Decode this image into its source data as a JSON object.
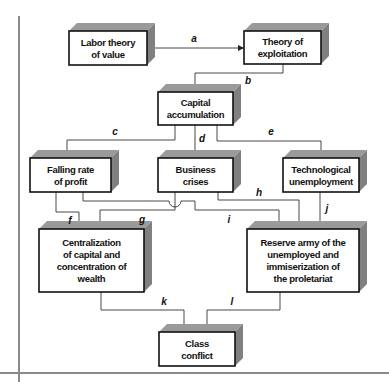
{
  "diagram": {
    "colors": {
      "face": "#ffffff",
      "border": "#111111",
      "shadow": "#9a9a9a",
      "rule": "#8a8a8a",
      "line": "#333333"
    },
    "nodes": [
      {
        "id": "labor_theory",
        "lines": [
          "Labor theory",
          "of value"
        ]
      },
      {
        "id": "exploitation",
        "lines": [
          "Theory of",
          "exploitation"
        ]
      },
      {
        "id": "capital_accumulation",
        "lines": [
          "Capital",
          "accumulation"
        ]
      },
      {
        "id": "falling_rate",
        "lines": [
          "Falling rate",
          "of profit"
        ]
      },
      {
        "id": "business_crises",
        "lines": [
          "Business",
          "crises"
        ]
      },
      {
        "id": "tech_unemployment",
        "lines": [
          "Technological",
          "unemployment"
        ]
      },
      {
        "id": "centralization",
        "lines": [
          "Centralization",
          "of capital and",
          "concentration of",
          "wealth"
        ]
      },
      {
        "id": "reserve_army",
        "lines": [
          "Reserve army of the",
          "unemployed and",
          "immiserization of",
          "the proletariat"
        ]
      },
      {
        "id": "class_conflict",
        "lines": [
          "Class",
          "conflict"
        ]
      }
    ],
    "edges": [
      {
        "label": "a",
        "from": "labor_theory",
        "to": "exploitation"
      },
      {
        "label": "b",
        "from": "exploitation",
        "to": "capital_accumulation"
      },
      {
        "label": "c",
        "from": "capital_accumulation",
        "to": "falling_rate"
      },
      {
        "label": "d",
        "from": "capital_accumulation",
        "to": "business_crises"
      },
      {
        "label": "e",
        "from": "capital_accumulation",
        "to": "tech_unemployment"
      },
      {
        "label": "f",
        "from": "falling_rate",
        "to": "centralization"
      },
      {
        "label": "g",
        "from": "business_crises",
        "to": "centralization"
      },
      {
        "label": "h",
        "from": "business_crises",
        "to": "reserve_army"
      },
      {
        "label": "i",
        "from": "falling_rate",
        "to": "reserve_army"
      },
      {
        "label": "j",
        "from": "tech_unemployment",
        "to": "reserve_army"
      },
      {
        "label": "k",
        "from": "centralization",
        "to": "class_conflict"
      },
      {
        "label": "l",
        "from": "reserve_army",
        "to": "class_conflict"
      }
    ]
  }
}
